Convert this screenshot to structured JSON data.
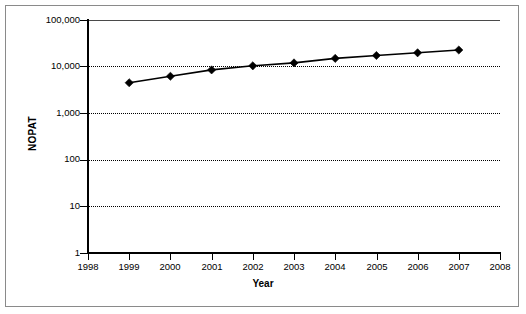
{
  "chart_data": {
    "type": "line",
    "title": "",
    "xlabel": "Year",
    "ylabel": "NOPAT",
    "x": [
      1999,
      2000,
      2001,
      2002,
      2003,
      2004,
      2005,
      2006,
      2007
    ],
    "values": [
      4500,
      6200,
      8500,
      10400,
      12000,
      15000,
      17300,
      19800,
      22700
    ],
    "series": [
      {
        "name": "NOPAT",
        "values": [
          4500,
          6200,
          8500,
          10400,
          12000,
          15000,
          17300,
          19800,
          22700
        ]
      }
    ],
    "x_tick_labels": [
      "1998",
      "1999",
      "2000",
      "2001",
      "2002",
      "2003",
      "2004",
      "2005",
      "2006",
      "2007",
      "2008"
    ],
    "x_ticks": [
      1998,
      1999,
      2000,
      2001,
      2002,
      2003,
      2004,
      2005,
      2006,
      2007,
      2008
    ],
    "xlim": [
      1998,
      2008
    ],
    "y_tick_labels": [
      "100,000",
      "10,000",
      "1,000",
      "100",
      "10",
      "1"
    ],
    "y_ticks": [
      100000,
      10000,
      1000,
      100,
      10,
      1
    ],
    "ylim": [
      1,
      100000
    ],
    "y_scale": "log",
    "grid": true,
    "grid_style": "dotted-horizontal",
    "legend": "none",
    "marker": "diamond",
    "line_color": "#000000",
    "marker_color": "#000000",
    "background_color": "#ffffff",
    "border_color": "#8a8a8a"
  }
}
